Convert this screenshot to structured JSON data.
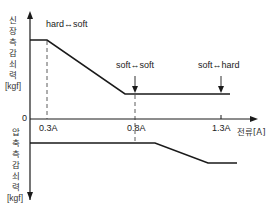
{
  "diagram": {
    "y_axis_upper": {
      "chars": [
        "신",
        "장",
        "측",
        "감",
        "쇠",
        "력"
      ],
      "unit": "[kgf]"
    },
    "y_axis_lower": {
      "chars": [
        "압",
        "축",
        "측",
        "감",
        "쇠",
        "력"
      ],
      "unit": "[kgf]"
    },
    "origin_label": "0",
    "x_axis_label": "전류[A]",
    "x_ticks": [
      "0.3A",
      "0.8A",
      "1.3A"
    ],
    "annotations": [
      {
        "text": "hard↔soft"
      },
      {
        "text": "soft↔soft"
      },
      {
        "text": "soft↔hard"
      }
    ],
    "colors": {
      "line": "#1a1a1a",
      "dash": "#333333"
    }
  }
}
